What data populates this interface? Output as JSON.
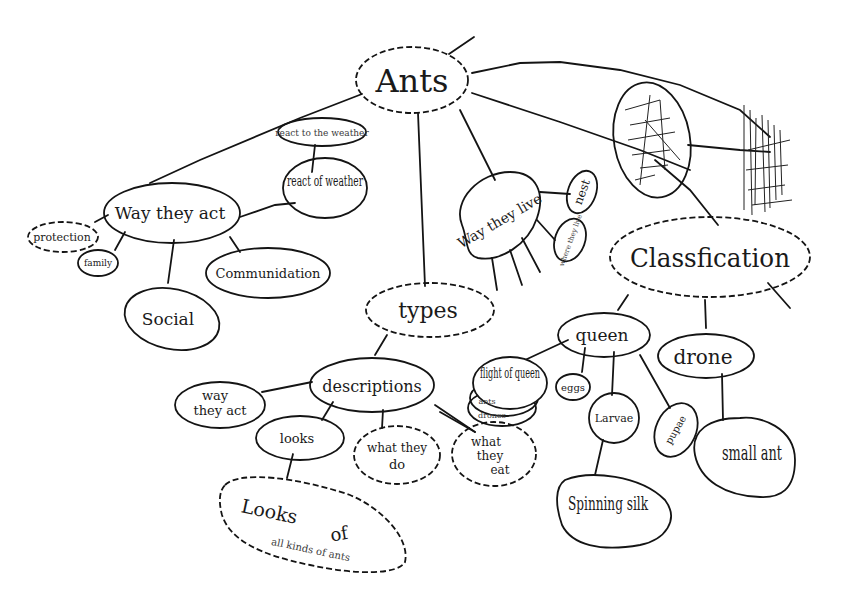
{
  "diagram": {
    "type": "concept-map",
    "style": "hand-drawn",
    "root": "Ants",
    "nodes": {
      "ants": "Ants",
      "react_small": "react to the weather",
      "way_they_act_main": "Way they act",
      "react_weather": "react of weather",
      "protection": "protection",
      "family": "family",
      "communication": "Communidation",
      "social": "Social",
      "types": "types",
      "way_they_live": "Way they live",
      "nest": "nest",
      "where_they_live": "where they live",
      "scribbled_node": "(scribbled out)",
      "classification": "Classfication",
      "queen": "queen",
      "drone": "drone",
      "small_ant": "small ant",
      "flight_of_queen": "flight of queen",
      "flight_sub1": "ants",
      "flight_sub2": "drones",
      "eggs": "eggs",
      "larvae": "Larvae",
      "pupae": "pupae",
      "spinning_silk": "Spinning silk",
      "descriptions": "descriptions",
      "way_they_act_desc_line1": "way",
      "way_they_act_desc_line2": "they act",
      "looks": "looks",
      "what_they_do_line1": "what they",
      "what_they_do_line2": "do",
      "what_they_eat_line1": "what",
      "what_they_eat_line2": "they",
      "what_they_eat_line3": "eat",
      "looks_of_line1": "Looks",
      "looks_of_line2": "of",
      "looks_of_line3": "all kinds of ants"
    },
    "edges": [
      [
        "Ants",
        "Way they act"
      ],
      [
        "Ants",
        "types"
      ],
      [
        "Ants",
        "Way they live"
      ],
      [
        "Ants",
        "Classfication"
      ],
      [
        "Ants",
        "(scribbled out)"
      ],
      [
        "Way they act",
        "react of weather"
      ],
      [
        "Way they act",
        "protection"
      ],
      [
        "Way they act",
        "family"
      ],
      [
        "Way they act",
        "Social"
      ],
      [
        "Way they act",
        "Communidation"
      ],
      [
        "react of weather",
        "react to the weather"
      ],
      [
        "Way they live",
        "nest"
      ],
      [
        "Way they live",
        "where they live"
      ],
      [
        "types",
        "descriptions"
      ],
      [
        "descriptions",
        "way they act"
      ],
      [
        "descriptions",
        "looks"
      ],
      [
        "descriptions",
        "what they do"
      ],
      [
        "descriptions",
        "what they eat"
      ],
      [
        "looks",
        "Looks of all kinds of ants"
      ],
      [
        "Classfication",
        "queen"
      ],
      [
        "Classfication",
        "drone"
      ],
      [
        "queen",
        "flight of queen"
      ],
      [
        "queen",
        "eggs"
      ],
      [
        "queen",
        "Larvae"
      ],
      [
        "queen",
        "pupae"
      ],
      [
        "Larvae",
        "Spinning silk"
      ],
      [
        "drone",
        "small ant"
      ]
    ]
  }
}
